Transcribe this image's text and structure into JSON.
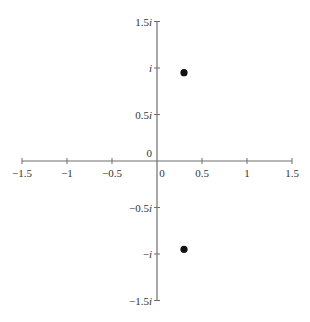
{
  "chart_data": {
    "type": "scatter",
    "title": "",
    "xlabel": "",
    "ylabel": "",
    "xlim": [
      -1.5,
      1.5
    ],
    "ylim": [
      -1.5,
      1.5
    ],
    "grid": false,
    "legend": null,
    "x_ticks": [
      {
        "value": -1.5,
        "label": "−1.5"
      },
      {
        "value": -1,
        "label": "−1"
      },
      {
        "value": -0.5,
        "label": "−0.5"
      },
      {
        "value": 0,
        "label": "0"
      },
      {
        "value": 0.5,
        "label": "0.5"
      },
      {
        "value": 1,
        "label": "1"
      },
      {
        "value": 1.5,
        "label": "1.5"
      }
    ],
    "y_ticks": [
      {
        "value": 1.5,
        "label": "1.5",
        "suffix": "i"
      },
      {
        "value": 1,
        "label": "",
        "suffix": "i"
      },
      {
        "value": 0.5,
        "label": "0.5",
        "suffix": "i"
      },
      {
        "value": 0,
        "label": "0",
        "suffix": ""
      },
      {
        "value": -0.5,
        "label": "−0.5",
        "suffix": "i"
      },
      {
        "value": -1,
        "label": "−",
        "suffix": "i"
      },
      {
        "value": -1.5,
        "label": "−1.5",
        "suffix": "i"
      }
    ],
    "series": [
      {
        "name": "points",
        "points": [
          {
            "x": 0.3,
            "y": 0.95
          },
          {
            "x": 0.3,
            "y": -0.95
          }
        ]
      }
    ],
    "colors": {
      "axis": "#6e6e6e",
      "point": "#111111",
      "text": "#333333",
      "background": "#ffffff"
    }
  }
}
